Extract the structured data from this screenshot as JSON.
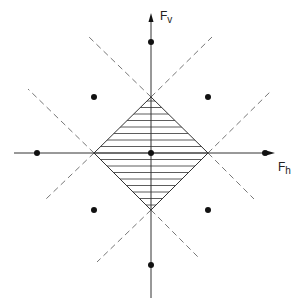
{
  "diagram": {
    "type": "force-space",
    "axes": {
      "vertical": {
        "label_main": "F",
        "label_sub": "v"
      },
      "horizontal": {
        "label_main": "F",
        "label_sub": "h"
      }
    },
    "center": [
      151,
      153
    ],
    "region": {
      "shape": "diamond",
      "fill": "horizontal-hatch",
      "vertices": [
        [
          151,
          97
        ],
        [
          208,
          153
        ],
        [
          151,
          210
        ],
        [
          94,
          153
        ]
      ]
    },
    "points": [
      [
        151,
        42
      ],
      [
        37,
        153
      ],
      [
        265,
        153
      ],
      [
        151,
        265
      ],
      [
        94,
        97
      ],
      [
        208,
        97
      ],
      [
        94,
        210
      ],
      [
        208,
        210
      ],
      [
        151,
        153
      ]
    ],
    "dashed_lines": [
      [
        [
          151,
          97
        ],
        [
          212,
          37
        ]
      ],
      [
        [
          94,
          153
        ],
        [
          46,
          199
        ]
      ],
      [
        [
          151,
          97
        ],
        [
          89,
          37
        ]
      ],
      [
        [
          208,
          153
        ],
        [
          254,
          199
        ]
      ],
      [
        [
          208,
          153
        ],
        [
          272,
          90
        ]
      ],
      [
        [
          151,
          210
        ],
        [
          97,
          262
        ]
      ],
      [
        [
          94,
          153
        ],
        [
          28,
          89
        ]
      ],
      [
        [
          151,
          210
        ],
        [
          200,
          259
        ]
      ]
    ],
    "colors": {
      "line": "#333333",
      "dash": "#777777",
      "dot": "#111111"
    }
  }
}
